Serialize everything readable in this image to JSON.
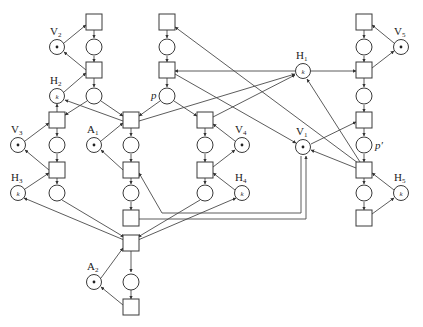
{
  "diagram": {
    "type": "petri-net",
    "colors": {
      "stroke": "#3a3a3a",
      "background": "#ffffff",
      "token": "#222222"
    },
    "labels": {
      "V1": {
        "main": "V",
        "sub": "1"
      },
      "V2": {
        "main": "V",
        "sub": "2"
      },
      "V3": {
        "main": "V",
        "sub": "3"
      },
      "V4": {
        "main": "V",
        "sub": "4"
      },
      "V5": {
        "main": "V",
        "sub": "5"
      },
      "H1": {
        "main": "H",
        "sub": "1"
      },
      "H2": {
        "main": "H",
        "sub": "2"
      },
      "H3": {
        "main": "H",
        "sub": "3"
      },
      "H4": {
        "main": "H",
        "sub": "4"
      },
      "H5": {
        "main": "H",
        "sub": "5"
      },
      "A1": {
        "main": "A",
        "sub": "1"
      },
      "A2": {
        "main": "A",
        "sub": "2"
      },
      "p": "p",
      "p_prime": "p′"
    },
    "token_k": "k",
    "places": [
      {
        "id": "V2",
        "x": 57,
        "y": 47,
        "tokens": "dot"
      },
      {
        "id": "H2",
        "x": 57,
        "y": 96,
        "tokens": "k"
      },
      {
        "id": "V3",
        "x": 18,
        "y": 145,
        "tokens": "dot"
      },
      {
        "id": "H3",
        "x": 18,
        "y": 193,
        "tokens": "k"
      },
      {
        "id": "A1",
        "x": 94,
        "y": 145,
        "tokens": "dot"
      },
      {
        "id": "V4",
        "x": 242,
        "y": 145,
        "tokens": "dot"
      },
      {
        "id": "H4",
        "x": 242,
        "y": 193,
        "tokens": "k"
      },
      {
        "id": "H1",
        "x": 303,
        "y": 71,
        "tokens": "k"
      },
      {
        "id": "V1",
        "x": 303,
        "y": 147,
        "tokens": "dot"
      },
      {
        "id": "V5",
        "x": 401,
        "y": 47,
        "tokens": "dot"
      },
      {
        "id": "H5",
        "x": 401,
        "y": 193,
        "tokens": "k"
      },
      {
        "id": "A2",
        "x": 94,
        "y": 282,
        "tokens": "dot"
      },
      {
        "id": "p",
        "x": 167,
        "y": 96,
        "tokens": "none"
      },
      {
        "id": "p_prime",
        "x": 364,
        "y": 145,
        "tokens": "none"
      }
    ],
    "transitions_count": 21,
    "places_count": 31
  }
}
